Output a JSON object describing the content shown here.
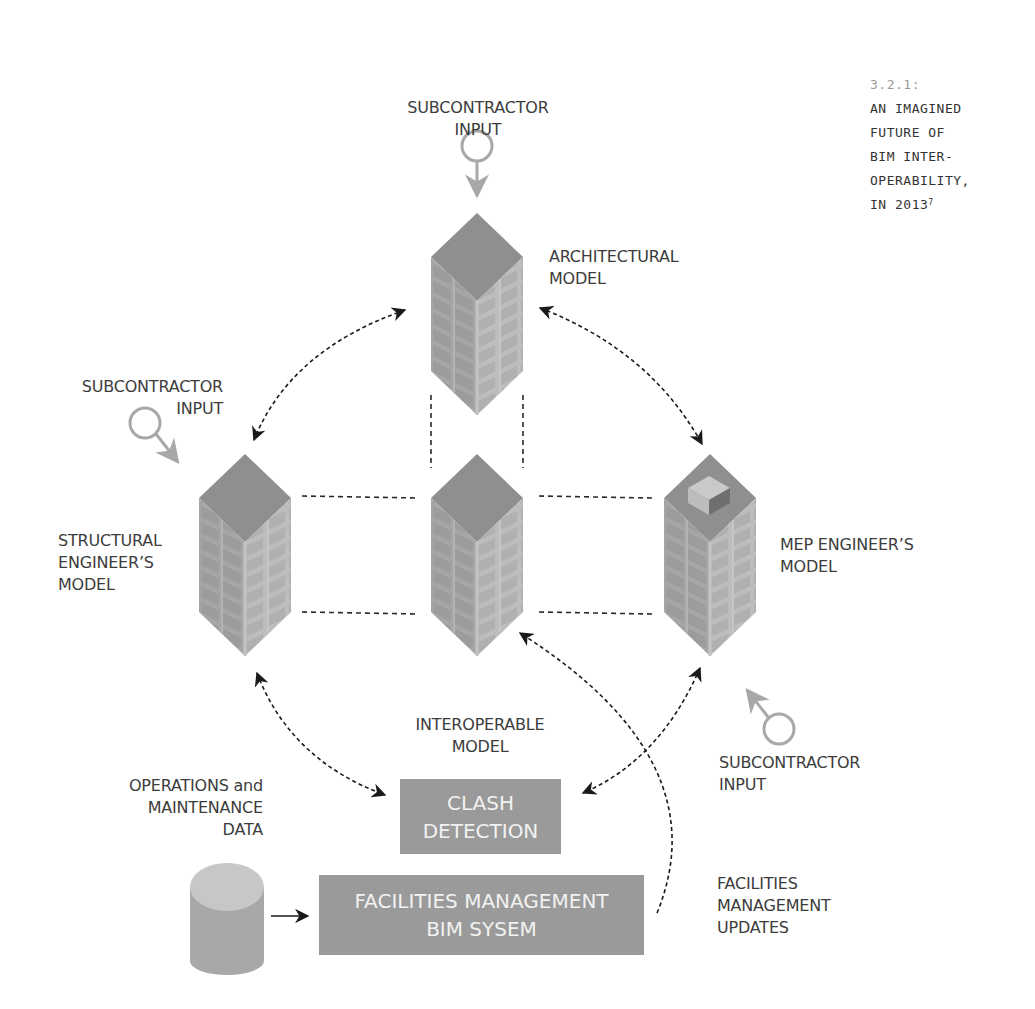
{
  "caption": {
    "number": "3.2.1:",
    "lines": [
      "AN IMAGINED",
      "FUTURE OF",
      "BIM INTER-",
      "OPERABILITY,",
      "IN 2013"
    ],
    "footnote": "7"
  },
  "nodes": {
    "architectural": {
      "label": "ARCHITECTURAL\nMODEL",
      "icon": "building-icon"
    },
    "structural": {
      "label": "STRUCTURAL\nENGINEER’S\nMODEL",
      "icon": "building-icon"
    },
    "interoperable": {
      "label": "INTEROPERABLE\nMODEL",
      "icon": "building-icon"
    },
    "mep": {
      "label": "MEP ENGINEER’S\nMODEL",
      "icon": "building-with-rooftop-unit-icon"
    },
    "clash_detection": {
      "label_line1": "CLASH",
      "label_line2": "DETECTION"
    },
    "fm_system": {
      "label_line1": "FACILITIES MANAGEMENT",
      "label_line2": "BIM SYSEM"
    },
    "om_data": {
      "label": "OPERATIONS and\nMAINTENANCE\nDATA",
      "icon": "database-cylinder-icon"
    }
  },
  "inputs": {
    "top": "SUBCONTRACTOR\nINPUT",
    "left": "SUBCONTRACTOR\nINPUT",
    "right": "SUBCONTRACTOR\nINPUT"
  },
  "annotations": {
    "fm_updates": "FACILITIES\nMANAGEMENT\nUPDATES"
  },
  "colors": {
    "box_fill": "#9a9a9a",
    "box_text": "#f2f2f2",
    "building_top": "#8f8f8f",
    "building_left": "#a3a3a3",
    "building_right": "#b5b5b5",
    "input_gray": "#a8a8a8",
    "arrow": "#1a1a1a"
  }
}
